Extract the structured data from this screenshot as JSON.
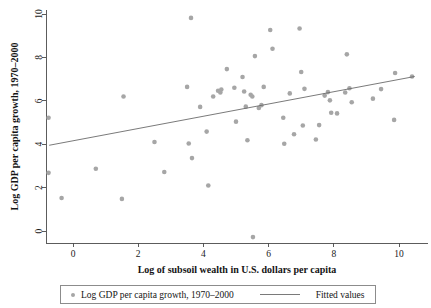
{
  "chart_data": {
    "type": "scatter",
    "title": "",
    "xlabel": "Log of subsoil wealth in U.S. dollars per capita",
    "ylabel": "Log GDP per capita growth, 1970–2000",
    "xlim": [
      -1.3,
      11.0
    ],
    "ylim": [
      -0.9,
      10.4
    ],
    "xticks": [
      "0",
      "2",
      "4",
      "6",
      "8",
      "10"
    ],
    "xtick_values": [
      0,
      2,
      4,
      6,
      8,
      10
    ],
    "yticks": [
      "0",
      "2",
      "4",
      "6",
      "8",
      "10"
    ],
    "ytick_values": [
      0,
      2,
      4,
      6,
      8,
      10
    ],
    "grid": false,
    "legend_position": "below",
    "marker_color": "#a6a6a6",
    "line_color": "#6b6b6b",
    "axis_color": "#4a4a4a",
    "series": [
      {
        "name": "Log GDP per capita growth, 1970–2000",
        "type": "scatter",
        "points": [
          [
            -0.75,
            5.22
          ],
          [
            -0.75,
            2.68
          ],
          [
            -0.35,
            1.52
          ],
          [
            0.7,
            2.87
          ],
          [
            1.5,
            1.48
          ],
          [
            1.55,
            6.2
          ],
          [
            2.5,
            4.1
          ],
          [
            2.8,
            2.72
          ],
          [
            3.5,
            6.64
          ],
          [
            3.55,
            4.03
          ],
          [
            3.62,
            9.82
          ],
          [
            3.65,
            3.36
          ],
          [
            3.9,
            5.72
          ],
          [
            4.1,
            4.58
          ],
          [
            4.15,
            2.1
          ],
          [
            4.3,
            6.2
          ],
          [
            4.45,
            6.46
          ],
          [
            4.52,
            6.38
          ],
          [
            4.55,
            6.52
          ],
          [
            4.72,
            7.46
          ],
          [
            4.95,
            6.6
          ],
          [
            5.0,
            5.04
          ],
          [
            5.2,
            7.1
          ],
          [
            5.25,
            6.43
          ],
          [
            5.3,
            5.73
          ],
          [
            5.35,
            4.18
          ],
          [
            5.45,
            6.28
          ],
          [
            5.5,
            6.2
          ],
          [
            5.52,
            -0.28
          ],
          [
            5.58,
            8.06
          ],
          [
            5.7,
            5.67
          ],
          [
            5.78,
            5.8
          ],
          [
            5.85,
            6.64
          ],
          [
            6.05,
            9.26
          ],
          [
            6.12,
            8.4
          ],
          [
            6.45,
            5.22
          ],
          [
            6.48,
            4.02
          ],
          [
            6.65,
            6.34
          ],
          [
            6.78,
            4.46
          ],
          [
            6.95,
            9.33
          ],
          [
            7.0,
            7.33
          ],
          [
            7.05,
            4.86
          ],
          [
            7.1,
            6.55
          ],
          [
            7.45,
            4.22
          ],
          [
            7.55,
            4.88
          ],
          [
            7.72,
            6.24
          ],
          [
            7.82,
            6.4
          ],
          [
            7.88,
            6.02
          ],
          [
            7.92,
            5.45
          ],
          [
            8.1,
            5.42
          ],
          [
            8.35,
            6.38
          ],
          [
            8.4,
            8.14
          ],
          [
            8.48,
            6.58
          ],
          [
            8.55,
            5.93
          ],
          [
            9.2,
            6.1
          ],
          [
            9.45,
            6.54
          ],
          [
            9.85,
            5.12
          ],
          [
            9.88,
            7.28
          ],
          [
            10.4,
            7.12
          ]
        ]
      },
      {
        "name": "Fitted values",
        "type": "line",
        "endpoints": [
          [
            -0.73,
            3.95
          ],
          [
            10.48,
            7.12
          ]
        ]
      }
    ]
  },
  "legend": {
    "scatter_label": "Log GDP per capita growth, 1970–2000",
    "line_label": "Fitted values"
  }
}
